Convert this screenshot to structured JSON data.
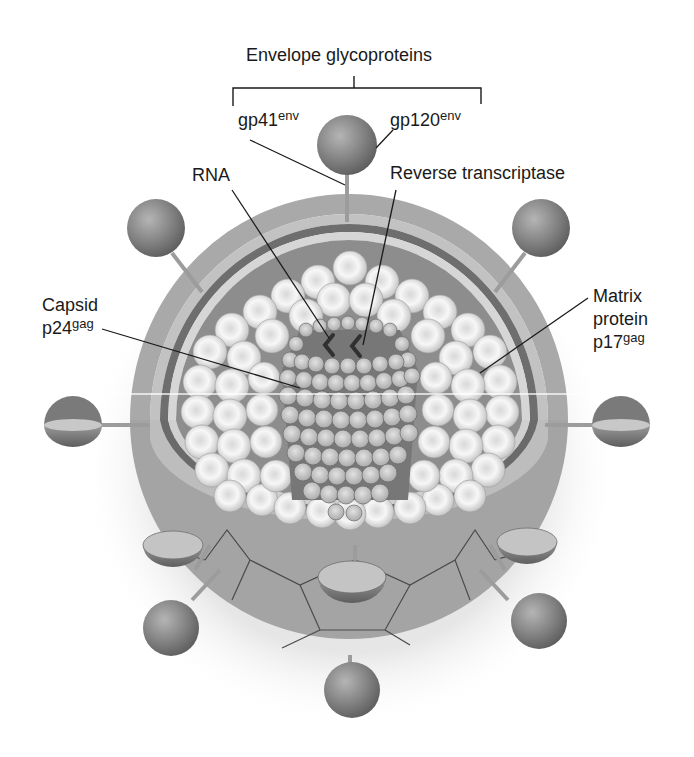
{
  "title": "Envelope glycoproteins",
  "labels": {
    "envelope": "Envelope glycoproteins",
    "gp41": {
      "base": "gp41",
      "sup": "env"
    },
    "gp120": {
      "base": "gp120",
      "sup": "env"
    },
    "rna": "RNA",
    "reverse_transcriptase": "Reverse transcriptase",
    "capsid": {
      "line1": "Capsid",
      "base": "p24",
      "sup": "gag"
    },
    "matrix": {
      "line1": "Matrix",
      "line2": "protein",
      "base": "p17",
      "sup": "gag"
    }
  },
  "colors": {
    "envelope_outer": "#a9a9a9",
    "envelope_inner": "#c4c4c4",
    "membrane_dark": "#6e6e6e",
    "matrix_fill": "#8e8e8e",
    "sphere_light": "#f4f4f4",
    "sphere_mid": "#cfcfcf",
    "capsid_unit": "#c8c8c8",
    "knob": "#7f7f7f",
    "text": "#1a1a1a"
  }
}
